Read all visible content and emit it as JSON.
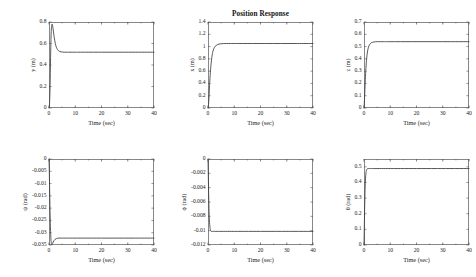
{
  "figure": {
    "title": "Position Response",
    "background_color": "#ffffff",
    "line_color": "#3a3a3a",
    "axis_color": "#555555",
    "width": 476,
    "height": 277
  },
  "chart_data": [
    {
      "type": "line",
      "id": "y-position",
      "title": "",
      "xlabel": "Time (sec)",
      "ylabel": "y (m)",
      "xlim": [
        0,
        40
      ],
      "ylim": [
        0,
        0.8
      ],
      "xticks": [
        0,
        10,
        20,
        30,
        40
      ],
      "xtick_labels": [
        "0",
        "10",
        "20",
        "30",
        "40"
      ],
      "yticks": [
        0,
        0.2,
        0.4,
        0.6,
        0.8
      ],
      "ytick_labels": [
        "0",
        "0.2",
        "0.4",
        "0.6",
        "0.8"
      ],
      "grid": false,
      "legend": "none",
      "steady_state": 0.52,
      "peak": 0.78,
      "x": [
        0,
        0.2,
        0.4,
        0.6,
        0.8,
        1.0,
        1.2,
        1.4,
        1.6,
        1.8,
        2.0,
        2.4,
        2.8,
        3.2,
        3.6,
        4.0,
        4.6,
        5.2,
        6.0,
        7.0,
        8.0,
        10.0,
        12.0,
        16.0,
        20.0,
        26.0,
        32.0,
        40.0
      ],
      "y": [
        0,
        0.04,
        0.2,
        0.47,
        0.68,
        0.765,
        0.78,
        0.762,
        0.728,
        0.69,
        0.655,
        0.6,
        0.565,
        0.545,
        0.533,
        0.527,
        0.522,
        0.52,
        0.519,
        0.519,
        0.519,
        0.519,
        0.519,
        0.519,
        0.519,
        0.519,
        0.519,
        0.519
      ]
    },
    {
      "type": "line",
      "id": "x-position",
      "title": "Position Response",
      "xlabel": "Time (sec)",
      "ylabel": "x (m)",
      "xlim": [
        0,
        40
      ],
      "ylim": [
        0,
        1.4
      ],
      "xticks": [
        0,
        10,
        20,
        30,
        40
      ],
      "xtick_labels": [
        "0",
        "10",
        "20",
        "30",
        "40"
      ],
      "yticks": [
        0,
        0.2,
        0.4,
        0.6,
        0.8,
        1.0,
        1.2,
        1.4
      ],
      "ytick_labels": [
        "0",
        "0.2",
        "0.4",
        "0.6",
        "0.8",
        "1",
        "1.2",
        "1.4"
      ],
      "grid": false,
      "legend": "none",
      "steady_state": 1.05,
      "x": [
        0,
        0.2,
        0.4,
        0.6,
        0.9,
        1.2,
        1.6,
        2.0,
        2.5,
        3.0,
        3.6,
        4.2,
        5.0,
        6.0,
        7.0,
        8.5,
        10.0,
        13.0,
        17.0,
        22.0,
        28.0,
        34.0,
        40.0
      ],
      "y": [
        0,
        0.06,
        0.2,
        0.37,
        0.58,
        0.73,
        0.865,
        0.94,
        0.99,
        1.015,
        1.032,
        1.041,
        1.046,
        1.049,
        1.05,
        1.05,
        1.05,
        1.05,
        1.05,
        1.05,
        1.05,
        1.05,
        1.05
      ]
    },
    {
      "type": "line",
      "id": "z-position",
      "title": "",
      "xlabel": "Time (sec)",
      "ylabel": "z (m)",
      "xlim": [
        0,
        40
      ],
      "ylim": [
        0,
        0.7
      ],
      "xticks": [
        0,
        10,
        20,
        30,
        40
      ],
      "xtick_labels": [
        "0",
        "10",
        "20",
        "30",
        "40"
      ],
      "yticks": [
        0,
        0.1,
        0.2,
        0.3,
        0.4,
        0.5,
        0.6,
        0.7
      ],
      "ytick_labels": [
        "0",
        "0.1",
        "0.2",
        "0.3",
        "0.4",
        "0.5",
        "0.6",
        "0.7"
      ],
      "grid": false,
      "legend": "none",
      "steady_state": 0.54,
      "x": [
        0,
        0.15,
        0.3,
        0.5,
        0.75,
        1.0,
        1.3,
        1.7,
        2.1,
        2.6,
        3.1,
        3.7,
        4.4,
        5.2,
        6.2,
        7.5,
        9.0,
        12.0,
        16.0,
        21.0,
        27.0,
        33.0,
        40.0
      ],
      "y": [
        0,
        0.05,
        0.13,
        0.23,
        0.33,
        0.4,
        0.455,
        0.495,
        0.515,
        0.528,
        0.534,
        0.537,
        0.539,
        0.54,
        0.54,
        0.54,
        0.54,
        0.54,
        0.54,
        0.54,
        0.54,
        0.54,
        0.54
      ]
    },
    {
      "type": "line",
      "id": "psi-yaw",
      "title": "",
      "xlabel": "Time (sec)",
      "ylabel": "ψ (rad)",
      "xlim": [
        0,
        40
      ],
      "ylim": [
        -0.035,
        0
      ],
      "xticks": [
        0,
        10,
        20,
        30,
        40
      ],
      "xtick_labels": [
        "0",
        "10",
        "20",
        "30",
        "40"
      ],
      "yticks": [
        0,
        -0.005,
        -0.01,
        -0.015,
        -0.02,
        -0.025,
        -0.03,
        -0.035
      ],
      "ytick_labels": [
        "0",
        "-0.005",
        "-0.01",
        "-0.015",
        "-0.02",
        "-0.025",
        "-0.03",
        "-0.035"
      ],
      "grid": false,
      "legend": "none",
      "steady_state": -0.0322,
      "trough": -0.0348,
      "x": [
        0,
        0.1,
        0.25,
        0.45,
        0.7,
        0.95,
        1.15,
        1.35,
        1.6,
        1.9,
        2.3,
        2.8,
        3.4,
        4.2,
        5.5,
        7.0,
        9.0,
        13.0,
        18.0,
        25.0,
        32.0,
        40.0
      ],
      "y": [
        0,
        -0.004,
        -0.013,
        -0.024,
        -0.032,
        -0.0345,
        -0.0348,
        -0.0344,
        -0.0338,
        -0.0332,
        -0.0327,
        -0.0324,
        -0.0322,
        -0.0322,
        -0.0322,
        -0.0322,
        -0.0322,
        -0.0322,
        -0.0322,
        -0.0322,
        -0.0322,
        -0.0322
      ]
    },
    {
      "type": "line",
      "id": "phi-roll",
      "title": "",
      "xlabel": "Time (sec)",
      "ylabel": "ϕ (rad)",
      "xlim": [
        0,
        40
      ],
      "ylim": [
        -0.012,
        0
      ],
      "xticks": [
        0,
        10,
        20,
        30,
        40
      ],
      "xtick_labels": [
        "0",
        "10",
        "20",
        "30",
        "40"
      ],
      "yticks": [
        0,
        -0.002,
        -0.004,
        -0.006,
        -0.008,
        -0.01,
        -0.012
      ],
      "ytick_labels": [
        "0",
        "-0.002",
        "-0.004",
        "-0.006",
        "-0.008",
        "-0.01",
        "-0.012"
      ],
      "grid": false,
      "legend": "none",
      "steady_state": -0.0101,
      "x": [
        0,
        0.08,
        0.18,
        0.3,
        0.45,
        0.6,
        0.8,
        1.0,
        1.3,
        1.7,
        2.2,
        3.0,
        4.0,
        6.0,
        9.0,
        14.0,
        20.0,
        28.0,
        40.0
      ],
      "y": [
        0,
        -0.0015,
        -0.0035,
        -0.0058,
        -0.0078,
        -0.0089,
        -0.0097,
        -0.01,
        -0.0101,
        -0.0101,
        -0.0101,
        -0.0101,
        -0.0101,
        -0.0101,
        -0.0101,
        -0.0101,
        -0.0101,
        -0.0101,
        -0.0101
      ]
    },
    {
      "type": "line",
      "id": "theta-pitch",
      "title": "",
      "xlabel": "Time (sec)",
      "ylabel": "θ (rad)",
      "xlim": [
        0,
        40
      ],
      "ylim": [
        0,
        0.55
      ],
      "xticks": [
        0,
        10,
        20,
        30,
        40
      ],
      "xtick_labels": [
        "0",
        "10",
        "20",
        "30",
        "40"
      ],
      "yticks": [
        0,
        0.1,
        0.2,
        0.3,
        0.4,
        0.5
      ],
      "ytick_labels": [
        "0",
        "0.1",
        "0.2",
        "0.3",
        "0.4",
        "0.5"
      ],
      "grid": false,
      "legend": "none",
      "steady_state": 0.489,
      "x": [
        0,
        0.08,
        0.18,
        0.3,
        0.45,
        0.62,
        0.8,
        1.0,
        1.25,
        1.6,
        2.1,
        2.8,
        4.0,
        6.0,
        9.0,
        14.0,
        20.0,
        28.0,
        40.0
      ],
      "y": [
        0,
        0.075,
        0.17,
        0.28,
        0.375,
        0.435,
        0.468,
        0.482,
        0.487,
        0.489,
        0.489,
        0.489,
        0.489,
        0.489,
        0.489,
        0.489,
        0.489,
        0.489,
        0.489
      ]
    }
  ]
}
